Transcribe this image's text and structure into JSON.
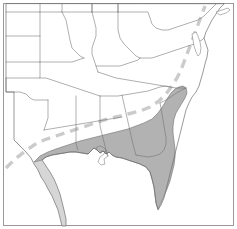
{
  "figure": {
    "type": "thematic-range-map",
    "title": "Southeastern United States distribution map",
    "width_px": 237,
    "height_px": 229,
    "background_color": "#ffffff",
    "frame_color": "#9a9a9a",
    "state_outline_color": "#6e6e6e",
    "coastline_color": "#6e6e6e",
    "core_range_fill": "#b2b2b2",
    "core_range_stroke": "#7a7a7a",
    "coastal_band_fill": "#cfcfcf",
    "dashed_line_color": "#cccccc",
    "legend_visible": false,
    "labels_visible": false,
    "scale_bar_visible": false,
    "north_arrow_visible": false
  },
  "layers": [
    {
      "id": "frame",
      "name": "map-frame",
      "visible": true
    },
    {
      "id": "coastal-band",
      "name": "light-gray-coastal-band",
      "visible": true
    },
    {
      "id": "core-range",
      "name": "shaded-range-polygon",
      "visible": true
    },
    {
      "id": "dashed-boundary",
      "name": "dashed-boundary-line",
      "visible": true
    },
    {
      "id": "state-borders",
      "name": "state-boundary-lines",
      "visible": true
    },
    {
      "id": "coastline",
      "name": "coastline-outline",
      "visible": true
    }
  ],
  "geometry": {
    "outer_coastline": "M6 4 L6 92 L14 92 L14 140 L20 146 L26 152 L31 158 L34 164 L38 170 L41 177 L45 183 L48 189 L52 196 L55 203 L58 210 L60 218 L62 226 L66 226 L66 219 L64 210 L62 202 L60 194 L57 186 L54 179 L50 172 L46 166 L42 160 L46 157 L52 155 L58 154 L64 153 L70 152 L76 152 L82 153 L88 154 L91 151 L94 148 L97 150 L100 153 L103 151 L106 154 L109 152 L112 155 L116 157 L122 158 L128 160 L134 162 L140 164 L146 167 L150 172 L152 179 L154 187 L155 195 L156 203 L158 210 L161 205 L164 198 L166 190 L168 182 L170 174 L172 166 L174 158 L176 150 L178 142 L180 134 L182 126 L184 118 L186 110 L189 103 L192 97 L196 92 L199 86 L201 79 L203 72 L205 64 L207 57 L208 50 L206 44 L204 38 L206 32 L209 26 L212 20 L216 14 L220 8 L224 4 Z",
    "gulf_coast": "M42 160 L46 157 L52 155 L58 154 L64 153 L70 152 L76 152 L82 153 L88 154 L91 151 L94 148 L97 150 L100 153 L103 151 L106 154 L109 152 L112 155 L116 157 L122 158 L128 160 L134 162 L140 164 L146 167",
    "florida_peninsula": "M146 167 L150 172 L152 179 L154 187 L155 195 L156 203 L158 210 L161 205 L164 198 L166 190 L168 182 L170 174 L172 166 L174 158",
    "atlantic_coast": "M174 158 L176 150 L178 142 L180 134 L182 126 L184 118 L186 110 L189 103 L192 97 L196 92 L199 86 L201 79 L203 72 L205 64 L207 57 L208 50 L206 44 L204 38 L206 32 L209 26 L212 20 L216 14 L220 8 L224 4",
    "core_range_polygon": "M34 162 L40 156 L48 152 L56 149 L62 147 L68 145 L74 143 L80 141 L88 139 L96 137 L104 135 L112 133 L120 131 L128 129 L136 126 L144 123 L152 119 L158 113 L163 106 L167 99 L171 93 L175 89 L179 87 L183 86 L186 88 L187 93 L185 98 L182 103 L179 108 L176 113 L174 119 L173 126 L173 133 L174 141 L175 149 L175 157 L174 165 L172 173 L170 181 L167 189 L164 196 L161 203 L158 209 L156 203 L155 195 L154 187 L152 179 L150 172 L146 167 L140 164 L134 162 L128 160 L122 158 L116 157 L112 155 L109 152 L106 154 L103 151 L100 153 L97 150 L94 148 L91 151 L88 154 L82 153 L76 152 L70 152 L64 153 L58 154 L52 155 L46 157 L42 160 Z",
    "coastal_band_texas": "M14 140 L20 146 L26 152 L31 158 L34 164 L38 170 L41 177 L45 183 L48 189 L52 196 L55 203 L58 210 L60 218 L62 226 L66 226 L66 219 L64 210 L62 202 L60 194 L57 186 L54 179 L50 172 L46 166 L42 160 L34 162 L30 157 L24 150 L18 143 L14 140 Z",
    "dashed_boundary": "M6 168 L14 160 L24 152 L34 145 L44 140 L56 136 L68 132 L80 128 L92 124 L104 120 L116 117 L128 114 L140 111 L150 107 L159 101 L166 94 L172 86 L177 78 L181 70 L184 62 L187 54 L190 46 L193 38 L196 30 L199 22 L202 14 L205 6"
  },
  "state_borders": [
    "M6 12 L40 12 L40 4",
    "M40 12 L40 62 L6 62",
    "M6 36 L40 36",
    "M40 12 L62 12 L62 4",
    "M62 12 L66 20 L68 30 L70 40 L72 48 L76 52 L80 56 L84 58",
    "M40 62 L40 78 L6 78",
    "M6 78 L6 92 L14 92",
    "M14 92 L20 92 L26 94 L30 98 L34 100 L40 100 L48 100",
    "M40 62 L72 62 L84 58",
    "M40 78 L46 78 L52 80 L58 82 L64 84 L70 86 L76 88 L82 90 L88 92 L94 94 L100 96",
    "M48 100 L48 118 L46 124 L44 130",
    "M62 12 L92 12 L92 4",
    "M92 12 L94 20 L96 28 L96 36 L94 42 L92 48 L92 54 L94 60 L96 66 L98 72",
    "M92 4 L92 12",
    "M92 12 L118 12 L118 4",
    "M118 12 L118 30 L120 38 L124 44 L128 48 L132 52 L136 56 L140 58",
    "M118 4 L118 12",
    "M118 12 L148 12 L150 18 L152 24 L156 28 L162 30 L168 30 L174 28 L180 26 L186 24 L192 22 L198 20 L204 16 L208 12 L212 8 L216 4",
    "M96 66 L102 66 L108 66 L114 66 L120 66 L126 64 L132 62 L138 60 L140 58",
    "M140 58 L146 58 L152 58 L158 56 L164 54 L170 52 L176 50 L182 48 L188 46 L194 44 L198 42 L202 40 L204 38",
    "M98 72 L104 74 L110 76 L116 78 L122 79 L128 80 L134 81 L140 82 L146 83 L152 84 L158 85 L164 86 L170 87 L176 88 L182 88 L186 88",
    "M100 96 L106 96 L112 96 L118 96 L124 95 L130 94 L136 93 L142 92 L148 91 L154 89 L160 87 L166 86 L170 87",
    "M44 130 L50 129 L56 128 L62 127 L68 126 L74 125 L80 124 L86 123 L92 122 L98 121 L104 120 L110 119 L116 118 L122 117",
    "M76 96 L76 104 L76 112 L76 120 L76 128 L76 136 L76 144 L78 150",
    "M100 96 L100 106 L100 116 L100 126 L102 134 L104 142 L106 150 L108 156",
    "M122 95 L124 104 L126 113 L128 122 L130 131 L132 140 L134 148 L136 155",
    "M136 155 L142 156 L148 157 L154 156 L160 154 L164 150 L166 144 L166 138 L165 132 L164 126 L163 120 L162 114 L161 108 L160 103",
    "M160 103 L166 100 L172 96 L178 92 L182 90 L186 88"
  ],
  "inset_details": {
    "chesapeake_bay": "M192 34 L193 40 L194 46 L196 52 L198 56 L200 54 L201 48 L200 42 L198 36 L196 32 Z",
    "long_island": "M216 12 L222 10 L228 8 L230 10 L226 13 L220 15 Z",
    "mississippi_delta": "M96 148 L99 146 L103 147 L106 150 L104 154 L100 157 L98 162 L101 165 L105 164 L104 159 L108 156 L106 152 L103 151 L100 153 L97 150 Z"
  },
  "regions_highlighted": [
    {
      "name": "southeast-texas-coast",
      "shade": "light"
    },
    {
      "name": "louisiana",
      "shade": "core"
    },
    {
      "name": "mississippi-coastal-plain",
      "shade": "core"
    },
    {
      "name": "alabama-coastal-plain",
      "shade": "core"
    },
    {
      "name": "south-georgia",
      "shade": "core"
    },
    {
      "name": "florida-peninsula",
      "shade": "core"
    },
    {
      "name": "south-carolina-coast",
      "shade": "core"
    }
  ]
}
